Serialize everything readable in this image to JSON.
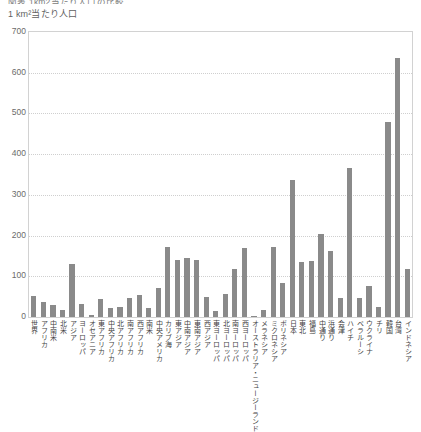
{
  "header": {
    "clipped_title": "図表  1km2当たり人口の比較",
    "axis_note": "1 km²当たり人口"
  },
  "chart_data": {
    "type": "bar",
    "title": "1 km²当たり人口",
    "xlabel": "",
    "ylabel": "1 km²当たり人口",
    "ylim": [
      0,
      700
    ],
    "ytick_step": 100,
    "ytick_labels": [
      "700",
      "600",
      "500",
      "400",
      "300",
      "200",
      "100",
      "0"
    ],
    "grid": true,
    "legend": "none",
    "bar_color": "#8a8a8a",
    "categories": [
      "世界",
      "アフリカ",
      "中南米",
      "北米",
      "アジア",
      "ヨーロッパ",
      "オセアニア",
      "東アフリカ",
      "中央アフリカ",
      "北アフリカ",
      "南アフリカ",
      "西アフリカ",
      "南米",
      "中央アメリカ",
      "カリブ海",
      "東アジア",
      "中南アジア",
      "東南アジア",
      "西アジア",
      "東ヨーロッパ",
      "北ヨーロッパ",
      "南ヨーロッパ",
      "西ヨーロッパ",
      "オーストラリア・ニュージーランド",
      "メラネシア",
      "ミクロネシア",
      "ポリネシア",
      "日本",
      "東北",
      "福島県",
      "中通り（福島県）",
      "浜通り（福島県）",
      "会津（福島県）",
      "ハイチ",
      "ベラルーシ",
      "ウクライナ",
      "チリ",
      "韓国",
      "台湾",
      "インドネシア"
    ],
    "values": [
      52,
      37,
      30,
      18,
      131,
      32,
      4,
      44,
      21,
      25,
      47,
      55,
      23,
      71,
      173,
      140,
      146,
      139,
      50,
      16,
      57,
      117,
      170,
      3,
      18,
      171,
      83,
      336,
      134,
      138,
      205,
      162,
      46,
      365,
      46,
      75,
      24,
      480,
      636,
      118
    ]
  },
  "bars": [
    {
      "label": "世界",
      "value": 52
    },
    {
      "label": "アフリカ",
      "value": 37
    },
    {
      "label": "中南米",
      "value": 30
    },
    {
      "label": "北米",
      "value": 18
    },
    {
      "label": "アジア",
      "value": 131
    },
    {
      "label": "ヨーロッパ",
      "value": 32
    },
    {
      "label": "オセアニア",
      "value": 4
    },
    {
      "label": "東アフリカ",
      "value": 44
    },
    {
      "label": "中央アフリカ",
      "value": 21
    },
    {
      "label": "北アフリカ",
      "value": 25
    },
    {
      "label": "南アフリカ",
      "value": 47
    },
    {
      "label": "西アフリカ",
      "value": 55
    },
    {
      "label": "南米",
      "value": 23
    },
    {
      "label": "中央アメリカ",
      "value": 71
    },
    {
      "label": "カリブ海",
      "value": 173
    },
    {
      "label": "東アジア",
      "value": 140
    },
    {
      "label": "中南アジア",
      "value": 146
    },
    {
      "label": "東南アジア",
      "value": 139
    },
    {
      "label": "西アジア",
      "value": 50
    },
    {
      "label": "東ヨーロッパ",
      "value": 16
    },
    {
      "label": "北ヨーロッパ",
      "value": 57
    },
    {
      "label": "南ヨーロッパ",
      "value": 117
    },
    {
      "label": "西ヨーロッパ",
      "value": 170
    },
    {
      "label": "オーストラリア・ニュージーランド",
      "value": 3
    },
    {
      "label": "メラネシア",
      "value": 18
    },
    {
      "label": "ミクロネシア",
      "value": 171
    },
    {
      "label": "ポリネシア",
      "value": 83
    },
    {
      "label": "日本",
      "value": 336
    },
    {
      "label": "東北",
      "value": 134
    },
    {
      "label": "福島県",
      "value": 138
    },
    {
      "label": "中通り（福島県）",
      "value": 205
    },
    {
      "label": "浜通り（福島県）",
      "value": 162
    },
    {
      "label": "会津（福島県）",
      "value": 46
    },
    {
      "label": "ハイチ",
      "value": 365
    },
    {
      "label": "ベラルーシ",
      "value": 46
    },
    {
      "label": "ウクライナ",
      "value": 75
    },
    {
      "label": "チリ",
      "value": 24
    },
    {
      "label": "韓国",
      "value": 480
    },
    {
      "label": "台湾",
      "value": 636
    },
    {
      "label": "インドネシア",
      "value": 118
    }
  ],
  "x_label_groups": [
    {
      "labels": [
        "世界",
        "アフリカ",
        "中南米",
        "北米",
        "アジア",
        "ヨーロッパ",
        "オセアニア"
      ]
    },
    {
      "labels": [
        "東アフリカ",
        "中央アフリカ",
        "北アフリカ",
        "南アフリカ",
        "西アフリカ"
      ]
    },
    {
      "labels": [
        "南米",
        "中央アメリカ",
        "カリブ海"
      ]
    },
    {
      "labels": [
        "東アジア",
        "中南アジア",
        "東南アジア",
        "西アジア"
      ]
    },
    {
      "labels": [
        "東ヨーロッパ",
        "北ヨーロッパ",
        "南ヨーロッパ",
        "西ヨーロッパ"
      ]
    },
    {
      "labels": [
        "オーストラリア・ニュージーランド",
        "メラネシア",
        "ミクロネシア",
        "ポリネシア"
      ]
    },
    {
      "labels": [
        "日本",
        "東北",
        "福島",
        "中通り",
        "浜通り",
        "会津"
      ]
    },
    {
      "labels": [
        "ハイチ",
        "ベラルーシ",
        "ウクライナ",
        "チリ",
        "韓国",
        "台湾",
        "インドネシア"
      ]
    }
  ]
}
